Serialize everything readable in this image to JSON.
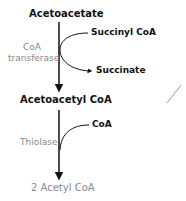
{
  "diagram": {
    "nodes": {
      "acetoacetate": "Acetoacetate",
      "acetoacetyl_coa": "Acetoacetyl CoA",
      "product": "2 Acetyl CoA"
    },
    "step1": {
      "enzyme_line1": "CoA",
      "enzyme_line2": "transferase",
      "input": "Succinyl CoA",
      "output": "Succinate"
    },
    "step2": {
      "enzyme": "Thiolase",
      "input": "CoA"
    },
    "colors": {
      "main_text": "#111111",
      "enzyme_text": "#8a8a8a",
      "arrow": "#111111",
      "stray_mark": "#9a9a9a"
    }
  }
}
